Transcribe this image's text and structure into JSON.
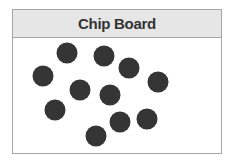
{
  "board": {
    "title": "Chip Board",
    "chip_color": "#353535",
    "chips": [
      {
        "x": 67,
        "y": 53
      },
      {
        "x": 104,
        "y": 56
      },
      {
        "x": 129,
        "y": 68
      },
      {
        "x": 43,
        "y": 76
      },
      {
        "x": 158,
        "y": 82
      },
      {
        "x": 80,
        "y": 90
      },
      {
        "x": 110,
        "y": 95
      },
      {
        "x": 55,
        "y": 110
      },
      {
        "x": 147,
        "y": 119
      },
      {
        "x": 120,
        "y": 122
      },
      {
        "x": 96,
        "y": 136
      }
    ]
  }
}
